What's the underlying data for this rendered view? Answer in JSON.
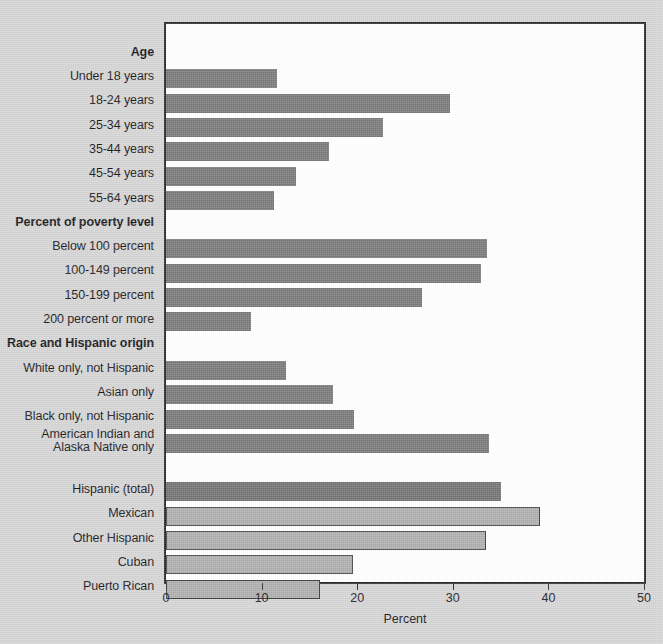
{
  "chart_data": {
    "type": "bar",
    "orientation": "horizontal",
    "title": "",
    "xlabel": "Percent",
    "ylabel": "",
    "xlim": [
      0,
      50
    ],
    "xticks": [
      0,
      10,
      20,
      30,
      40,
      50
    ],
    "xtick_labels": [
      "0",
      "10",
      "20",
      "30",
      "40",
      "50"
    ],
    "grid": false,
    "legend": "none",
    "colors": {
      "background": "#d3d3d3",
      "plot_background": "#ffffff",
      "axis": "#242424",
      "bar_dark": "#757575",
      "bar_mid": "#6f6f6f",
      "bar_light": "#ababab",
      "bar_light_outline": "#3a3a3a",
      "text": "#101010"
    },
    "groups": [
      {
        "header": "Age",
        "categories": [
          "Under 18 years",
          "18-24 years",
          "25-34 years",
          "35-44 years",
          "45-54 years",
          "55-64 years"
        ],
        "values": [
          11.6,
          29.7,
          22.7,
          17.1,
          13.6,
          11.3
        ],
        "style": "dark"
      },
      {
        "header": "Percent of poverty level",
        "categories": [
          "Below 100 percent",
          "100-149 percent",
          "150-199 percent",
          "200 percent or more"
        ],
        "values": [
          33.6,
          32.9,
          26.8,
          8.9
        ],
        "style": "dark"
      },
      {
        "header": "Race and Hispanic origin",
        "categories": [
          "White only, not Hispanic",
          "Asian only",
          "Black only, not Hispanic",
          "American Indian and\nAlaska Native only"
        ],
        "values": [
          12.5,
          17.5,
          19.7,
          33.8
        ],
        "style": "dark"
      },
      {
        "header": "",
        "categories": [
          "Hispanic (total)",
          "Mexican",
          "Other Hispanic",
          "Cuban",
          "Puerto Rican"
        ],
        "values": [
          35.0,
          39.1,
          33.5,
          19.6,
          16.1
        ],
        "styles": [
          "mid",
          "light",
          "light",
          "light",
          "light"
        ],
        "spacer_before": true
      }
    ]
  }
}
